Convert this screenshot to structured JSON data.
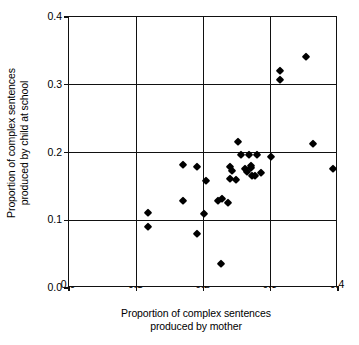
{
  "chart_data": {
    "type": "scatter",
    "title": "",
    "xlabel": "Proportion of complex sentences produced by mother",
    "xlabel_line1": "Proportion of complex sentences",
    "xlabel_line2": "produced by mother",
    "ylabel": "Proportion of complex sentences produced by child at school",
    "ylabel_line1": "Proportion of complex sentences",
    "ylabel_line2": "produced by child at school",
    "xlim": [
      0.0,
      0.4
    ],
    "ylim": [
      0.0,
      0.4
    ],
    "xticks": [
      0.0,
      0.1,
      0.2,
      0.3,
      0.4
    ],
    "yticks": [
      0.0,
      0.1,
      0.2,
      0.3,
      0.4
    ],
    "xticklabels": [
      "0.0",
      "0.1",
      "0.2",
      "0.3",
      "0.4"
    ],
    "yticklabels": [
      "0.0",
      "0.1",
      "0.2",
      "0.3",
      "0.4"
    ],
    "grid": true,
    "grid_color": "#111111",
    "legend": "none",
    "marker": "diamond",
    "marker_color": "#000000",
    "n_points": 33,
    "points": [
      {
        "x": 0.118,
        "y": 0.111
      },
      {
        "x": 0.118,
        "y": 0.09
      },
      {
        "x": 0.169,
        "y": 0.182
      },
      {
        "x": 0.169,
        "y": 0.128
      },
      {
        "x": 0.19,
        "y": 0.178
      },
      {
        "x": 0.19,
        "y": 0.079
      },
      {
        "x": 0.2,
        "y": 0.109
      },
      {
        "x": 0.204,
        "y": 0.158
      },
      {
        "x": 0.222,
        "y": 0.129
      },
      {
        "x": 0.228,
        "y": 0.131
      },
      {
        "x": 0.226,
        "y": 0.035
      },
      {
        "x": 0.237,
        "y": 0.126
      },
      {
        "x": 0.24,
        "y": 0.178
      },
      {
        "x": 0.242,
        "y": 0.172
      },
      {
        "x": 0.24,
        "y": 0.161
      },
      {
        "x": 0.249,
        "y": 0.159
      },
      {
        "x": 0.252,
        "y": 0.216
      },
      {
        "x": 0.256,
        "y": 0.196
      },
      {
        "x": 0.262,
        "y": 0.176
      },
      {
        "x": 0.265,
        "y": 0.171
      },
      {
        "x": 0.267,
        "y": 0.196
      },
      {
        "x": 0.27,
        "y": 0.18
      },
      {
        "x": 0.271,
        "y": 0.177
      },
      {
        "x": 0.272,
        "y": 0.166
      },
      {
        "x": 0.276,
        "y": 0.165
      },
      {
        "x": 0.28,
        "y": 0.196
      },
      {
        "x": 0.285,
        "y": 0.17
      },
      {
        "x": 0.301,
        "y": 0.194
      },
      {
        "x": 0.314,
        "y": 0.321
      },
      {
        "x": 0.314,
        "y": 0.307
      },
      {
        "x": 0.352,
        "y": 0.341
      },
      {
        "x": 0.363,
        "y": 0.213
      },
      {
        "x": 0.393,
        "y": 0.175
      }
    ]
  },
  "axes": {
    "x_tick_labels": [
      "0.0",
      "0.1",
      "0.2",
      "0.3",
      "0.4"
    ],
    "y_tick_labels": [
      "0.0",
      "0.1",
      "0.2",
      "0.3",
      "0.4"
    ]
  }
}
